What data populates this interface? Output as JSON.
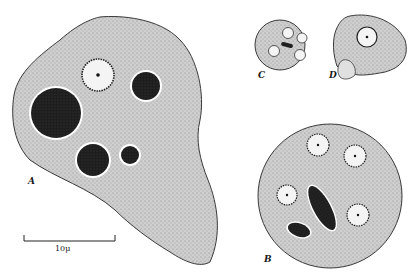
{
  "figure": {
    "panels": [
      {
        "id": "A",
        "label": "A"
      },
      {
        "id": "B",
        "label": "B"
      },
      {
        "id": "C",
        "label": "C"
      },
      {
        "id": "D",
        "label": "D"
      }
    ],
    "scale_bar": {
      "label": "10μ"
    }
  },
  "colors": {
    "cytoplasm": "#c9c9c9",
    "outline": "#3a3a3a",
    "dark_inclusion": "#1e1e1e",
    "nucleus_fill": "#f4f4f4",
    "background": "#ffffff"
  }
}
